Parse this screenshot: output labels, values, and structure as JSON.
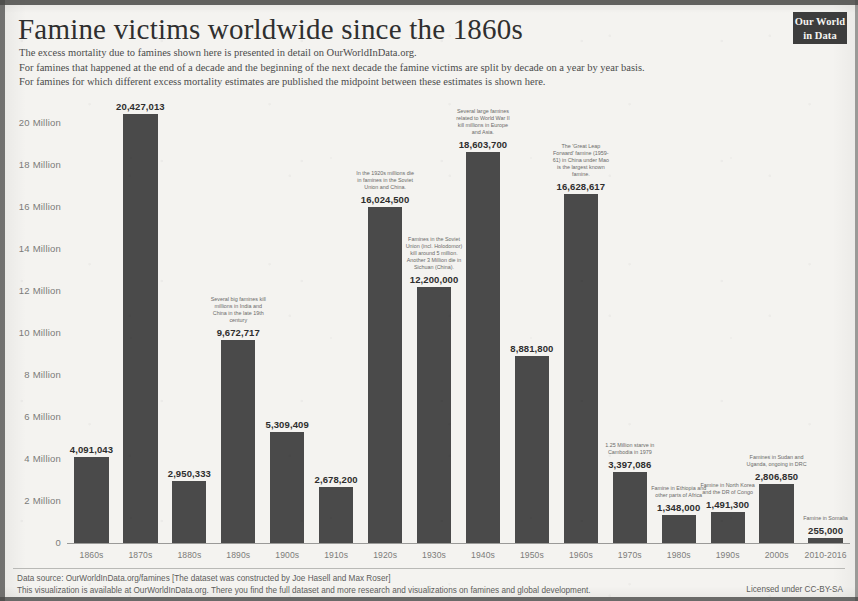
{
  "header": {
    "title": "Famine victims worldwide since the 1860s",
    "subtitle_lines": [
      "The excess mortality due to famines shown here is presented in detail on OurWorldInData.org.",
      "For famines that happened at the end of a decade and the beginning of the next decade the famine victims are split by decade on a year by year basis.",
      "For famines for which different excess mortality estimates are published the midpoint between these estimates is shown here."
    ],
    "logo_line1": "Our World",
    "logo_line2": "in Data"
  },
  "footer": {
    "lines": [
      "Data source: OurWorldInData.org/famines [The dataset was constructed by Joe Hasell and Max Roser]",
      "This visualization is available at OurWorldInData.org. There you find the full dataset and more research and visualizations on famines and global development."
    ],
    "license": "Licensed under CC-BY-SA"
  },
  "chart_data": {
    "type": "bar",
    "title": "Famine victims worldwide since the 1860s",
    "xlabel": "",
    "ylabel": "",
    "ylim": [
      0,
      21000000
    ],
    "grid": false,
    "legend": "none",
    "bar_color": "#4a4a4a",
    "categories": [
      "1860s",
      "1870s",
      "1880s",
      "1890s",
      "1900s",
      "1910s",
      "1920s",
      "1930s",
      "1940s",
      "1950s",
      "1960s",
      "1970s",
      "1980s",
      "1990s",
      "2000s",
      "2010-2016"
    ],
    "values": [
      4091043,
      20427013,
      2950333,
      9672717,
      5309409,
      2678200,
      16024500,
      12200000,
      18603700,
      8881800,
      16628617,
      3397086,
      1348000,
      1491300,
      2806850,
      255000
    ],
    "value_labels": [
      "4,091,043",
      "20,427,013",
      "2,950,333",
      "9,672,717",
      "5,309,409",
      "2,678,200",
      "16,024,500",
      "12,200,000",
      "18,603,700",
      "8,881,800",
      "16,628,617",
      "3,397,086",
      "1,348,000",
      "1,491,300",
      "2,806,850",
      "255,000"
    ],
    "ytick_labels": [
      "0",
      "2 Million",
      "4 Million",
      "6 Million",
      "8 Million",
      "10 Million",
      "12 Million",
      "14 Million",
      "16 Million",
      "18 Million",
      "20 Million"
    ],
    "ytick_values": [
      0,
      2000000,
      4000000,
      6000000,
      8000000,
      10000000,
      12000000,
      14000000,
      16000000,
      18000000,
      20000000
    ],
    "annotations": [
      {
        "category": "1890s",
        "text": "Several big famines kill millions in India and China in the late 19th century"
      },
      {
        "category": "1920s",
        "text": "In the 1920s millions die in famines in the Soviet Union and China."
      },
      {
        "category": "1930s",
        "text": "Famines in the Soviet Union (incl. Holodomor) kill around 5 million. Another 3 Million die in Sichuan (China)."
      },
      {
        "category": "1940s",
        "text": "Several large famines related to World War II kill millions in Europe and Asia."
      },
      {
        "category": "1960s",
        "text": "The 'Great Leap Forward' famine (1959-61) in China under Mao is the largest known famine."
      },
      {
        "category": "1970s",
        "text": "1.25 Million starve in Cambodia in 1979"
      },
      {
        "category": "1980s",
        "text": "Famine in Ethiopia and other parts of Africa"
      },
      {
        "category": "1990s",
        "text": "Famine in North Korea and the DR of Congo"
      },
      {
        "category": "2000s",
        "text": "Famines in Sudan and Uganda, ongoing in DRC"
      },
      {
        "category": "2010-2016",
        "text": "Famine in Somalia"
      }
    ]
  }
}
